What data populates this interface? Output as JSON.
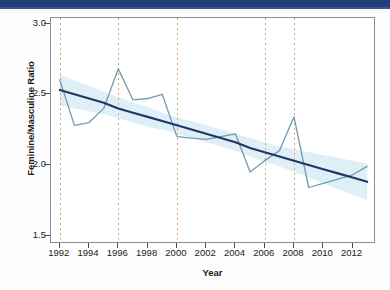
{
  "banner": {
    "color": "#1f3f7a"
  },
  "chart_data": {
    "type": "line",
    "title": "",
    "xlabel": "Year",
    "ylabel": "Feminine/Masculine Ratio",
    "xlim": [
      1991.4,
      2013.6
    ],
    "ylim": [
      1.44,
      3.04
    ],
    "grid": false,
    "legend": "none",
    "xticks": [
      1992,
      1994,
      1996,
      1998,
      2000,
      2002,
      2004,
      2006,
      2008,
      2010,
      2012
    ],
    "xtick_labels": [
      "1992",
      "1994",
      "1996",
      "1998",
      "2000",
      "2002",
      "2004",
      "2006",
      "2008",
      "2010",
      "2012"
    ],
    "yticks": [
      1.5,
      2.0,
      2.5,
      3.0
    ],
    "ytick_labels": [
      "1.5",
      "2.0",
      "2.5",
      "3.0"
    ],
    "x": [
      1992,
      1993,
      1994,
      1995,
      1996,
      1997,
      1998,
      1999,
      2000,
      2001,
      2002,
      2003,
      2004,
      2005,
      2006,
      2007,
      2008,
      2009,
      2010,
      2011,
      2012,
      2013
    ],
    "series": [
      {
        "name": "Feminine/Masculine Ratio",
        "color": "#6f9cb0",
        "style": "solid",
        "values": [
          2.6,
          2.28,
          2.3,
          2.4,
          2.68,
          2.46,
          2.47,
          2.5,
          2.2,
          2.19,
          2.18,
          2.2,
          2.22,
          1.95,
          2.03,
          2.1,
          2.34,
          1.84,
          1.87,
          1.9,
          1.93,
          1.99
        ]
      },
      {
        "name": "Linear trend",
        "color": "#22356b",
        "style": "solid",
        "values": [
          2.53,
          2.5,
          2.47,
          2.44,
          2.4,
          2.37,
          2.34,
          2.31,
          2.28,
          2.25,
          2.22,
          2.19,
          2.16,
          2.12,
          2.09,
          2.06,
          2.03,
          2.0,
          1.97,
          1.94,
          1.91,
          1.88
        ]
      }
    ],
    "confidence_band": {
      "name": "95% confidence interval",
      "color": "#d8ecf5",
      "upper": [
        2.64,
        2.6,
        2.56,
        2.52,
        2.48,
        2.44,
        2.41,
        2.37,
        2.34,
        2.31,
        2.28,
        2.25,
        2.22,
        2.19,
        2.16,
        2.13,
        2.11,
        2.09,
        2.07,
        2.05,
        2.03,
        2.01
      ],
      "lower": [
        2.42,
        2.4,
        2.38,
        2.36,
        2.33,
        2.3,
        2.27,
        2.25,
        2.22,
        2.19,
        2.16,
        2.13,
        2.1,
        2.06,
        2.02,
        1.99,
        1.95,
        1.91,
        1.87,
        1.83,
        1.79,
        1.75
      ]
    },
    "vertical_reference_lines": {
      "name": "election years",
      "color": "#e8a05c",
      "style": "dotted",
      "values": [
        1992,
        1996,
        2000,
        2006,
        2008
      ]
    }
  }
}
